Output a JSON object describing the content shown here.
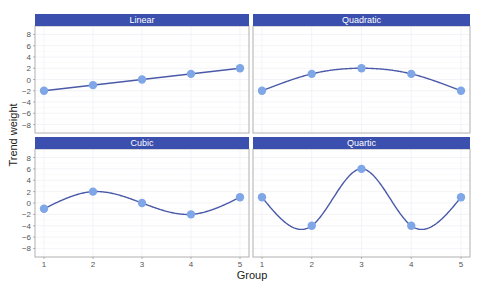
{
  "chart_data": {
    "type": "line",
    "title": "",
    "xlabel": "Group",
    "ylabel": "Trend weight",
    "x": [
      1,
      2,
      3,
      4,
      5
    ],
    "x_ticks": [
      "1",
      "2",
      "3",
      "4",
      "5"
    ],
    "y_ticks": [
      8,
      6,
      4,
      2,
      0,
      -2,
      -4,
      -6,
      -8
    ],
    "ylim": [
      -9.5,
      9.5
    ],
    "grid": true,
    "legend": null,
    "facets": [
      {
        "name": "Linear",
        "values": [
          -2,
          -1,
          0,
          1,
          2
        ]
      },
      {
        "name": "Quadratic",
        "values": [
          -2,
          1,
          2,
          1,
          -2
        ]
      },
      {
        "name": "Cubic",
        "values": [
          -1,
          2,
          0,
          -2,
          1
        ]
      },
      {
        "name": "Quartic",
        "values": [
          1,
          -4,
          6,
          -4,
          1
        ]
      }
    ],
    "colors": {
      "strip": "#3a4fae",
      "strip_text": "#ffffff",
      "line": "#4a5aa8",
      "point": "#7fa6e6",
      "panel_border": "#b0b0b0",
      "grid": "#ececf4"
    }
  },
  "labels": {
    "xlabel": "Group",
    "ylabel": "Trend weight"
  }
}
